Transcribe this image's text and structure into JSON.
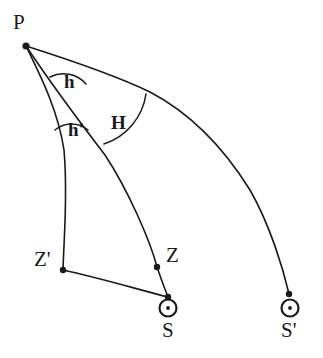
{
  "figure": {
    "type": "spherical-astronomy-diagram",
    "background_color": "#ffffff",
    "stroke_color": "#1a1a1a",
    "canvas": {
      "width": 323,
      "height": 358
    }
  },
  "points": [
    {
      "id": "P",
      "label": "P",
      "x": 26,
      "y": 46,
      "label_x": 13,
      "label_y": 12,
      "marker": "dot",
      "desc": "celestial-pole"
    },
    {
      "id": "Zp",
      "label": "Z'",
      "x": 63,
      "y": 270,
      "label_x": 34,
      "label_y": 249,
      "marker": "dot",
      "desc": "zenith-prime"
    },
    {
      "id": "Z",
      "label": "Z",
      "x": 157,
      "y": 267,
      "label_x": 166,
      "label_y": 245,
      "marker": "dot",
      "desc": "zenith"
    },
    {
      "id": "S",
      "label": "S",
      "x": 168,
      "y": 297,
      "label_x": 160,
      "label_y": 320,
      "marker": "sun",
      "desc": "sun-position"
    },
    {
      "id": "Sp",
      "label": "S'",
      "x": 289,
      "y": 294,
      "label_x": 280,
      "label_y": 320,
      "marker": "sun",
      "desc": "sun-position-prime"
    }
  ],
  "angles": [
    {
      "id": "h",
      "label": "h",
      "label_x": 64,
      "label_y": 72,
      "desc": "altitude-angle"
    },
    {
      "id": "hp",
      "label": "h'",
      "label_x": 68,
      "label_y": 120,
      "desc": "altitude-prime-angle"
    },
    {
      "id": "H",
      "label": "H",
      "label_x": 111,
      "label_y": 113,
      "desc": "hour-angle"
    }
  ],
  "paths": {
    "p_to_zprime": "M26,46 C40,75 58,110 64,150 C68,195 64,235 63,270",
    "p_to_s": "M26,46 C52,85 82,125 105,155 C128,190 150,240 157,267 C162,282 166,292 168,297",
    "p_to_sprime": "M26,46 C70,60 115,75 150,92 C190,113 222,145 250,190 C270,225 283,268 289,294",
    "zprime_to_s": "M63,270 C100,278 140,290 168,297"
  },
  "arcs": {
    "h": "M50,77 A30,30 0 0 1 86,84",
    "hp": "M55,130 A26,26 0 0 1 88,130",
    "H": "M104,144 A62,62 0 0 0 146,94"
  },
  "sun_symbol": {
    "outer_radius": 8.5,
    "inner_radius": 1.9,
    "stroke_width": 2.2
  }
}
